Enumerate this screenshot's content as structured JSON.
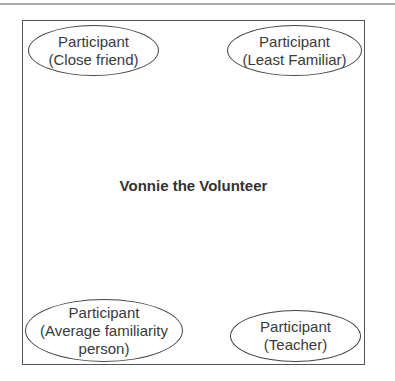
{
  "diagram": {
    "center_label": "Vonnie the Volunteer",
    "nodes": [
      {
        "id": "top-left",
        "line1": "Participant",
        "line2": "(Close friend)"
      },
      {
        "id": "top-right",
        "line1": "Participant",
        "line2": "(Least Familiar)"
      },
      {
        "id": "bottom-left",
        "line1": "Participant",
        "line2": "(Average familiarity",
        "line3": "person)"
      },
      {
        "id": "bottom-right",
        "line1": "Participant",
        "line2": "(Teacher)"
      }
    ]
  }
}
